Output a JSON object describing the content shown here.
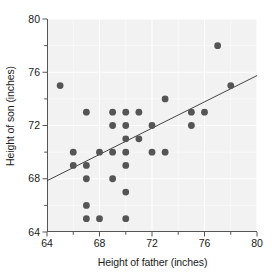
{
  "chart_data": {
    "type": "scatter",
    "title": "",
    "xlabel": "Height of father (inches)",
    "ylabel": "Height of son (inches)",
    "xlim": [
      64,
      80
    ],
    "ylim": [
      64,
      80
    ],
    "xticks": [
      64,
      68,
      72,
      76,
      80
    ],
    "yticks": [
      64,
      68,
      72,
      76,
      80
    ],
    "x_minor_tick_step": 2,
    "y_minor_tick_step": 2,
    "grid": true,
    "grid_color": "#ffffff",
    "plot_background": "#f2f2f2",
    "legend": null,
    "marker_color": "#555555",
    "marker_size": 3.4,
    "points": [
      {
        "x": 65.0,
        "y": 75.0
      },
      {
        "x": 66.0,
        "y": 70.0
      },
      {
        "x": 66.0,
        "y": 69.0
      },
      {
        "x": 67.0,
        "y": 69.0
      },
      {
        "x": 67.0,
        "y": 73.0
      },
      {
        "x": 67.0,
        "y": 68.0
      },
      {
        "x": 67.0,
        "y": 66.0
      },
      {
        "x": 67.0,
        "y": 65.0
      },
      {
        "x": 68.0,
        "y": 70.0
      },
      {
        "x": 68.0,
        "y": 65.0
      },
      {
        "x": 69.0,
        "y": 73.0
      },
      {
        "x": 69.0,
        "y": 72.0
      },
      {
        "x": 69.0,
        "y": 70.0
      },
      {
        "x": 69.0,
        "y": 68.0
      },
      {
        "x": 70.0,
        "y": 73.0
      },
      {
        "x": 70.0,
        "y": 72.0
      },
      {
        "x": 70.0,
        "y": 71.0
      },
      {
        "x": 70.0,
        "y": 70.0
      },
      {
        "x": 70.0,
        "y": 69.0
      },
      {
        "x": 70.0,
        "y": 67.0
      },
      {
        "x": 70.0,
        "y": 65.0
      },
      {
        "x": 71.0,
        "y": 73.0
      },
      {
        "x": 71.0,
        "y": 71.0
      },
      {
        "x": 72.0,
        "y": 72.0
      },
      {
        "x": 72.0,
        "y": 70.0
      },
      {
        "x": 73.0,
        "y": 74.0
      },
      {
        "x": 73.0,
        "y": 70.0
      },
      {
        "x": 75.0,
        "y": 73.0
      },
      {
        "x": 75.0,
        "y": 72.0
      },
      {
        "x": 76.0,
        "y": 73.0
      },
      {
        "x": 77.0,
        "y": 78.0
      },
      {
        "x": 78.0,
        "y": 75.0
      }
    ],
    "trend_line": {
      "type": "linear-fit",
      "x_start": 64,
      "y_start": 67.85,
      "x_end": 80,
      "y_end": 75.75,
      "color": "#444444"
    }
  },
  "axes": {
    "y_tick_labels": [
      "80",
      "76",
      "72",
      "68",
      "64"
    ],
    "x_tick_labels": [
      "64",
      "68",
      "72",
      "76",
      "80"
    ]
  }
}
